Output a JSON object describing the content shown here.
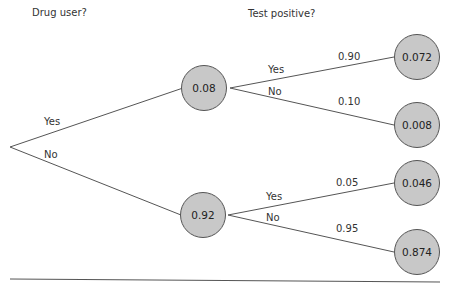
{
  "headers": {
    "level1": "Drug user?",
    "level2": "Test positive?"
  },
  "root": {
    "branches": [
      {
        "label": "Yes",
        "node_value": "0.08",
        "children": [
          {
            "label": "Yes",
            "prob": "0.90",
            "joint": "0.072"
          },
          {
            "label": "No",
            "prob": "0.10",
            "joint": "0.008"
          }
        ]
      },
      {
        "label": "No",
        "node_value": "0.92",
        "children": [
          {
            "label": "Yes",
            "prob": "0.05",
            "joint": "0.046"
          },
          {
            "label": "No",
            "prob": "0.95",
            "joint": "0.874"
          }
        ]
      }
    ]
  },
  "colors": {
    "node_fill": "#c8c8c8",
    "node_stroke": "#555555",
    "line": "#555555"
  }
}
